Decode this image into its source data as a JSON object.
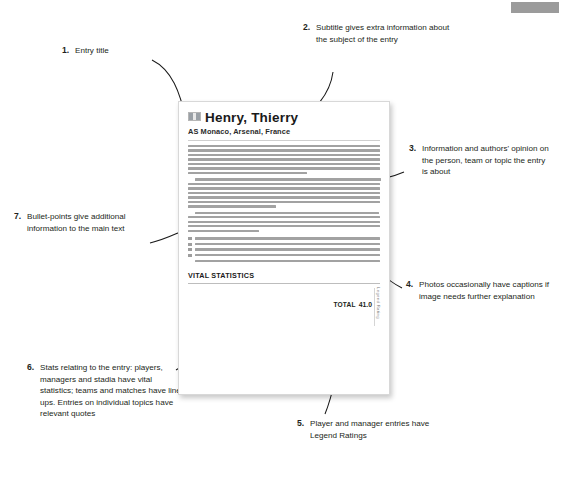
{
  "page": {
    "background_color": "#ffffff",
    "top_tab_color": "#9b9b9b"
  },
  "annotations": [
    {
      "number": "1.",
      "text": "Entry title",
      "target": "entry-title"
    },
    {
      "number": "2.",
      "text": "Subtitle gives extra information about the subject of the entry",
      "target": "entry-subtitle"
    },
    {
      "number": "3.",
      "text": "Information and authors' opinion on the person, team or topic the entry is about",
      "target": "entry-body"
    },
    {
      "number": "4.",
      "text": "Photos occasionally have captions if image needs further explanation",
      "target": "entry-photo-caption"
    },
    {
      "number": "5.",
      "text": "Player and manager entries have Legend Ratings",
      "target": "legend-ratings"
    },
    {
      "number": "6.",
      "text": "Stats relating to the entry: players, managers and stadia have vital statistics; teams and matches have line-ups. Entries on individual topics have relevant quotes",
      "target": "vital-statistics"
    },
    {
      "number": "7.",
      "text": "Bullet-points give additional information to the main text",
      "target": "bullet-points"
    }
  ],
  "document": {
    "flag_icon": "monaco-flag-icon",
    "title": "Henry, Thierry",
    "subtitle": "AS Monaco, Arsenal, France",
    "body_paragraph_line_counts": [
      7,
      7,
      5
    ],
    "bullet_count": 4,
    "vital_statistics": {
      "heading": "VITAL STATISTICS",
      "row_count": 6,
      "legend_ratings_row_count": 5,
      "total_label": "TOTAL",
      "total_value": "41.0",
      "vertical_label": "Legend Rating"
    }
  }
}
